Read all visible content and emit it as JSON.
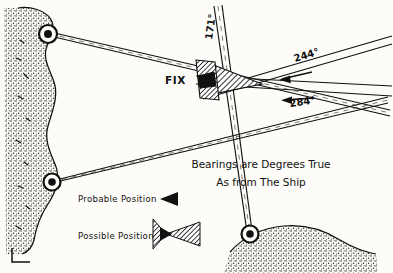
{
  "figure": {
    "background_color": "#fdfcf8",
    "ink_color": "#111111",
    "fix_label": "FIX"
  },
  "bearings": [
    {
      "id": "bearing-171",
      "label": "171°",
      "degrees": 171,
      "from_landmark": "bottom-right-landmark",
      "orientation": "near-vertical"
    },
    {
      "id": "bearing-244",
      "label": "244°",
      "degrees": 244,
      "from_landmark": "top-left-landmark",
      "orientation": "upper-right-to-fix"
    },
    {
      "id": "bearing-284",
      "label": "284°",
      "degrees": 284,
      "from_landmark": "mid-left-landmark",
      "orientation": "lower-right-to-fix"
    }
  ],
  "landmarks": [
    {
      "id": "top-left-landmark",
      "symbol": "circle-with-dot"
    },
    {
      "id": "mid-left-landmark",
      "symbol": "circle-with-dot"
    },
    {
      "id": "bottom-right-landmark",
      "symbol": "circle-with-dot"
    }
  ],
  "legend": {
    "items": [
      {
        "label": "Probable Position",
        "symbol": "solid-triangle"
      },
      {
        "label": "Possible Position",
        "symbol": "hatched-triangle-pair"
      }
    ]
  },
  "note": {
    "line1": "Bearings are Degrees True",
    "line2": "As from The Ship"
  }
}
